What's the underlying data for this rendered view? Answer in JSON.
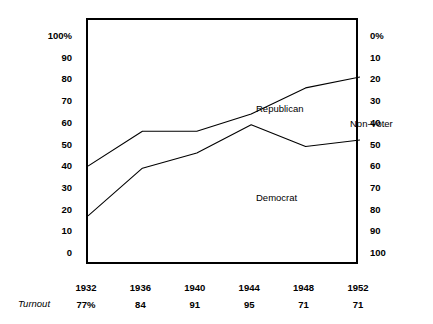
{
  "chart_data": {
    "type": "area",
    "title": "",
    "subtitle": "",
    "xlabel": "",
    "ylabel": "",
    "grid": false,
    "legend_position": "inline-annotations",
    "categories": [
      "1932",
      "1936",
      "1940",
      "1944",
      "1948",
      "1952"
    ],
    "x_positions_pct": [
      0,
      20,
      40,
      60,
      80,
      100
    ],
    "left_axis": {
      "label_suffix": "%",
      "ylim": [
        0,
        100
      ],
      "ticks": [
        "100%",
        "90",
        "80",
        "70",
        "60",
        "50",
        "40",
        "30",
        "20",
        "10",
        "0"
      ],
      "tick_values": [
        100,
        90,
        80,
        70,
        60,
        50,
        40,
        30,
        20,
        10,
        0
      ],
      "direction": "ascending-upward"
    },
    "right_axis": {
      "label_suffix": "%",
      "ylim": [
        0,
        100
      ],
      "ticks": [
        "0%",
        "10",
        "20",
        "30",
        "40",
        "50",
        "60",
        "70",
        "80",
        "90",
        "100"
      ],
      "tick_values": [
        0,
        10,
        20,
        30,
        40,
        50,
        60,
        70,
        80,
        90,
        100
      ],
      "direction": "descending-downward"
    },
    "series": [
      {
        "name": "Democrat",
        "description": "lower boundary line — cumulative Democrat share",
        "values": [
          18,
          40,
          47,
          60,
          50,
          53
        ]
      },
      {
        "name": "Republican",
        "description": "upper boundary line — cumulative Democrat + Republican share",
        "values": [
          41,
          57,
          57,
          65,
          77,
          82
        ]
      },
      {
        "name": "Non-Voter",
        "description": "region above the upper boundary line, read on right axis",
        "values": [
          59,
          43,
          43,
          35,
          23,
          18
        ]
      }
    ],
    "annotations": [
      {
        "text": "Republican",
        "x": "1940",
        "y": 77
      },
      {
        "text": "Non-Voter",
        "x": "1948",
        "y": 70
      },
      {
        "text": "Democrat",
        "x": "1940",
        "y": 37
      }
    ],
    "turnout_row_label": "Turnout",
    "turnout_values": [
      "77%",
      "84",
      "91",
      "95",
      "71",
      "71"
    ],
    "colors": {
      "line": "#000000",
      "frame": "#000000",
      "background": "#ffffff",
      "text": "#000000"
    }
  },
  "labels": {
    "series": {
      "republican": "Republican",
      "nonvoter": "Non-Voter",
      "democrat": "Democrat"
    },
    "turnout_caption": "Turnout"
  }
}
